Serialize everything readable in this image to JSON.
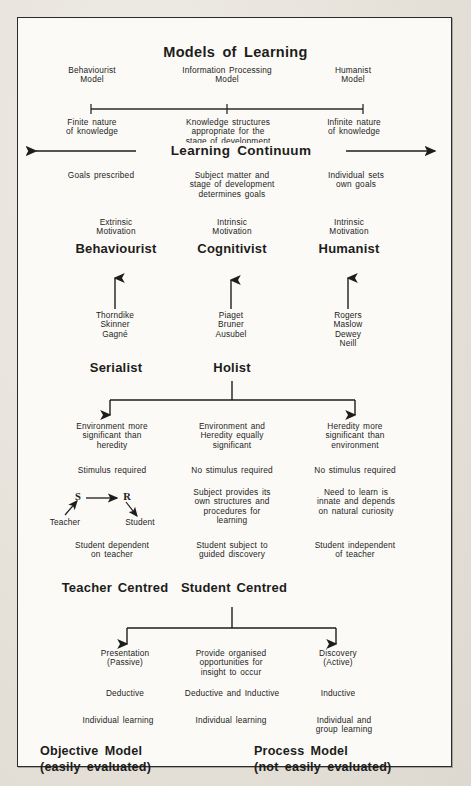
{
  "document": {
    "title": "Models of Learning",
    "continuum_label": "Learning Continuum"
  },
  "scale_row": {
    "models": [
      "Behaviourist\nModel",
      "Information Processing\nModel",
      "Humanist\nModel"
    ],
    "descriptions": [
      "Finite nature\nof knowledge",
      "Knowledge structures\nappropriate for the\nstage of development",
      "Infinite nature\nof knowledge"
    ]
  },
  "goals_row": [
    "Goals prescribed",
    "Subject matter and\nstage of development\ndetermines goals",
    "Individual sets\nown goals"
  ],
  "motivation_row": [
    "Extrinsic\nMotivation",
    "Intrinsic\nMotivation",
    "Intrinsic\nMotivation"
  ],
  "theory_headings": [
    "Behaviourist",
    "Cognitivist",
    "Humanist"
  ],
  "theorists_row": [
    "Thorndike\nSkinner\nGagné",
    "Piaget\nBruner\nAusubel",
    "Rogers\nMaslow\nDewey\nNeill"
  ],
  "style_headings": {
    "serialist": "Serialist",
    "holist": "Holist"
  },
  "nature_nurture_row": [
    "Environment more\nsignificant than\nheredity",
    "Environment and\nHeredity equally\nsignificant",
    "Heredity more\nsignificant than\nenvironment"
  ],
  "stimulus_row": [
    "Stimulus required",
    "No stimulus required",
    "No stimulus required"
  ],
  "mechanism_row": {
    "sr_diagram": {
      "stimulus_letter": "S",
      "response_letter": "R",
      "teacher_label": "Teacher",
      "student_label": "Student"
    },
    "middle": "Subject provides its\nown structures and\nprocedures for\nlearning",
    "right": "Need to learn is\ninnate and depends\non natural curiosity"
  },
  "dependence_row": [
    "Student dependent\non teacher",
    "Student subject to\nguided discovery",
    "Student independent\nof teacher"
  ],
  "centred_headings": {
    "teacher": "Teacher Centred",
    "student": "Student Centred"
  },
  "method_row": [
    "Presentation\n(Passive)",
    "Provide organised\nopportunities for\ninsight to occur",
    "Discovery\n(Active)"
  ],
  "reasoning_row": [
    "Deductive",
    "Deductive and Inductive",
    "Inductive"
  ],
  "grouping_row": [
    "Individual learning",
    "Individual learning",
    "Individual and\ngroup learning"
  ],
  "conclusion": {
    "objective": "Objective Model\n(easily evaluated)",
    "process": "Process Model\n(not easily evaluated)"
  },
  "colors": {
    "ink": "#1d1d1b",
    "frame": "#2b2b2b",
    "paper": "#fbfaf7",
    "scan_background": "#e6e2da"
  }
}
